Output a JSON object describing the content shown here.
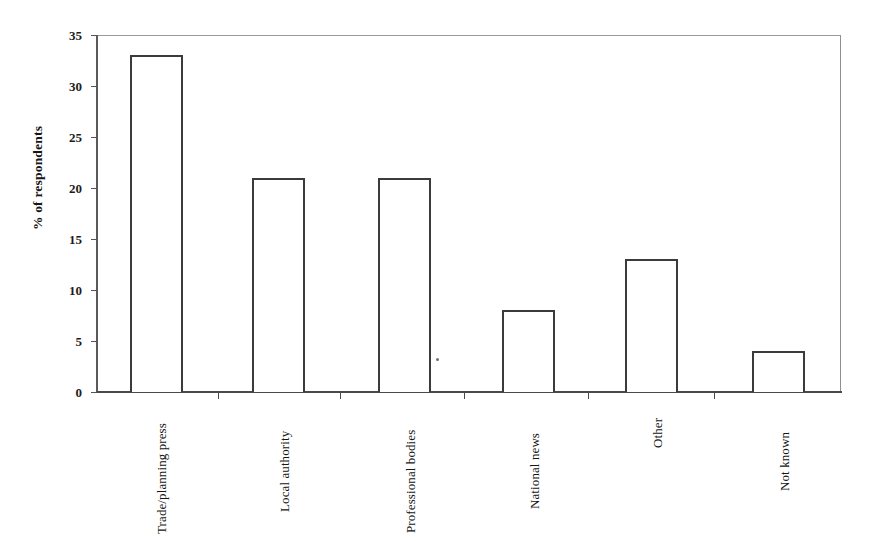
{
  "chart_data": {
    "type": "bar",
    "title": "",
    "subtitle": "",
    "xlabel": "",
    "ylabel": "% of respondents",
    "categories": [
      "Trade/planning press",
      "Local authority",
      "Professional bodies",
      "National news",
      "Other",
      "Not known"
    ],
    "values": [
      33,
      21,
      21,
      8,
      13,
      4
    ],
    "ylim": [
      0,
      35
    ],
    "ytick_step": 5,
    "ytick_labels": [
      "0",
      "5",
      "10",
      "15",
      "20",
      "25",
      "30",
      "35"
    ],
    "grid": false,
    "legend": false,
    "legend_position": "none",
    "bar_style": {
      "fill": "#ffffff",
      "edge": "#3b3b3b",
      "edge_width_px": 2
    },
    "annotations": []
  },
  "axes": {
    "y_title": "% of respondents",
    "y_ticks": [
      {
        "value": 35,
        "label": "35"
      },
      {
        "value": 30,
        "label": "30"
      },
      {
        "value": 25,
        "label": "25"
      },
      {
        "value": 20,
        "label": "20"
      },
      {
        "value": 15,
        "label": "15"
      },
      {
        "value": 10,
        "label": "10"
      },
      {
        "value": 5,
        "label": "5"
      },
      {
        "value": 0,
        "label": "0"
      }
    ]
  },
  "colors": {
    "background": "#ffffff",
    "frame": "#8a8a8a",
    "axis": "#4a4a4a",
    "bar_edge": "#3b3b3b",
    "text": "#141414"
  }
}
